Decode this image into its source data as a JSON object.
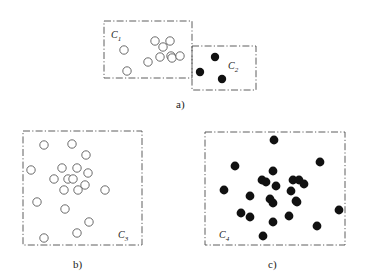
{
  "figure": {
    "title": "",
    "background": "#ffffff",
    "width": 377,
    "height": 280
  },
  "colors": {
    "box_stroke": "#4d4d4d",
    "open_point_stroke": "#5a5a5a",
    "open_point_fill": "#ffffff",
    "filled_point": "#111111",
    "text": "#1a1a1a"
  },
  "panels": [
    {
      "id": "panel-a",
      "label": "a)",
      "label_x": 176,
      "label_y": 98
    },
    {
      "id": "panel-b",
      "label": "b)",
      "label_x": 73,
      "label_y": 258
    },
    {
      "id": "panel-c",
      "label": "c)",
      "label_x": 268,
      "label_y": 258
    }
  ],
  "chart_data": {
    "type": "scatter",
    "title": "",
    "xlabel": "",
    "ylabel": "",
    "grid": false,
    "legend": "none",
    "clusters": [
      {
        "name": "C1",
        "label_text": "C",
        "label_sub": "1",
        "panel": "a",
        "marker": "open-circle",
        "box": {
          "x": 104,
          "y": 21,
          "w": 88,
          "h": 57
        },
        "label_pos": {
          "x": 111,
          "y": 38
        },
        "point_radius": 4.2,
        "points": [
          [
            124,
            50
          ],
          [
            148,
            62
          ],
          [
            155,
            41
          ],
          [
            163,
            47
          ],
          [
            160,
            57
          ],
          [
            171,
            56
          ],
          [
            172,
            58
          ],
          [
            180,
            56
          ],
          [
            170,
            41
          ],
          [
            127,
            71
          ]
        ]
      },
      {
        "name": "C2",
        "label_text": "C",
        "label_sub": "2",
        "panel": "a",
        "marker": "filled-dot",
        "box": {
          "x": 192,
          "y": 46,
          "w": 64,
          "h": 44
        },
        "label_pos": {
          "x": 228,
          "y": 69
        },
        "point_radius": 4.2,
        "points": [
          [
            215,
            57
          ],
          [
            200,
            72
          ],
          [
            222,
            79
          ]
        ]
      },
      {
        "name": "C3",
        "label_text": "C",
        "label_sub": "3",
        "panel": "b",
        "marker": "open-circle",
        "box": {
          "x": 23,
          "y": 131,
          "w": 119,
          "h": 114
        },
        "label_pos": {
          "x": 118,
          "y": 238
        },
        "point_radius": 4.2,
        "points": [
          [
            44,
            145
          ],
          [
            72,
            144
          ],
          [
            86,
            155
          ],
          [
            31,
            170
          ],
          [
            62,
            168
          ],
          [
            77,
            168
          ],
          [
            54,
            179
          ],
          [
            68,
            179
          ],
          [
            73,
            179
          ],
          [
            88,
            173
          ],
          [
            85,
            185
          ],
          [
            64,
            190
          ],
          [
            78,
            190
          ],
          [
            105,
            190
          ],
          [
            37,
            202
          ],
          [
            65,
            209
          ],
          [
            89,
            222
          ],
          [
            77,
            233
          ],
          [
            44,
            238
          ]
        ]
      },
      {
        "name": "C4",
        "label_text": "C",
        "label_sub": "4",
        "panel": "c",
        "marker": "filled-dot",
        "box": {
          "x": 205,
          "y": 132,
          "w": 140,
          "h": 113
        },
        "label_pos": {
          "x": 219,
          "y": 238
        },
        "point_radius": 4.4,
        "points": [
          [
            274,
            140
          ],
          [
            320,
            162
          ],
          [
            235,
            166
          ],
          [
            273,
            171
          ],
          [
            262,
            180
          ],
          [
            266,
            182
          ],
          [
            293,
            180
          ],
          [
            299,
            180
          ],
          [
            304,
            184
          ],
          [
            276,
            186
          ],
          [
            224,
            190
          ],
          [
            291,
            191
          ],
          [
            250,
            196
          ],
          [
            270,
            199
          ],
          [
            273,
            203
          ],
          [
            296,
            201
          ],
          [
            297,
            202
          ],
          [
            241,
            213
          ],
          [
            250,
            217
          ],
          [
            289,
            216
          ],
          [
            339,
            210
          ],
          [
            273,
            222
          ],
          [
            317,
            226
          ],
          [
            263,
            236
          ]
        ]
      }
    ]
  }
}
